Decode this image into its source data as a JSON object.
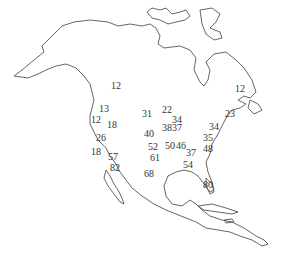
{
  "map": {
    "region": "North America outline",
    "text_color": "#333333",
    "line_color": "#555555",
    "labels": [
      {
        "value": "12",
        "x": 111,
        "y": 86
      },
      {
        "value": "13",
        "x": 99,
        "y": 109
      },
      {
        "value": "12",
        "x": 91,
        "y": 120
      },
      {
        "value": "18",
        "x": 107,
        "y": 125
      },
      {
        "value": "26",
        "x": 96,
        "y": 138
      },
      {
        "value": "18",
        "x": 91,
        "y": 152
      },
      {
        "value": "57",
        "x": 108,
        "y": 157
      },
      {
        "value": "82",
        "x": 110,
        "y": 168
      },
      {
        "value": "31",
        "x": 142,
        "y": 114
      },
      {
        "value": "22",
        "x": 162,
        "y": 110
      },
      {
        "value": "34",
        "x": 172,
        "y": 120
      },
      {
        "value": "38",
        "x": 162,
        "y": 128
      },
      {
        "value": "37",
        "x": 172,
        "y": 128
      },
      {
        "value": "40",
        "x": 144,
        "y": 134
      },
      {
        "value": "52",
        "x": 148,
        "y": 147
      },
      {
        "value": "50",
        "x": 165,
        "y": 146
      },
      {
        "value": "46",
        "x": 176,
        "y": 146
      },
      {
        "value": "61",
        "x": 150,
        "y": 158
      },
      {
        "value": "37",
        "x": 186,
        "y": 153
      },
      {
        "value": "68",
        "x": 144,
        "y": 174
      },
      {
        "value": "54",
        "x": 183,
        "y": 165
      },
      {
        "value": "80",
        "x": 203,
        "y": 185
      },
      {
        "value": "34",
        "x": 209,
        "y": 127
      },
      {
        "value": "35",
        "x": 203,
        "y": 138
      },
      {
        "value": "48",
        "x": 203,
        "y": 149
      },
      {
        "value": "23",
        "x": 225,
        "y": 114
      },
      {
        "value": "12",
        "x": 235,
        "y": 89
      }
    ]
  }
}
